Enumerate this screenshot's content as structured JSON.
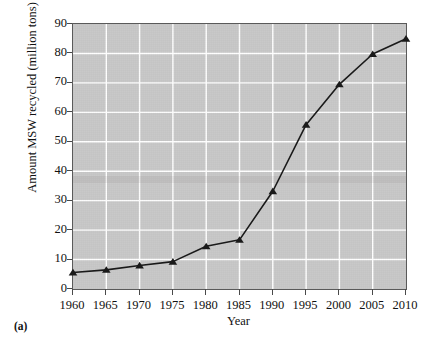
{
  "figure": {
    "panel_label": "(a)",
    "background_color": "#ffffff",
    "plot_background_color": "#c8c8c8",
    "gridline_color": "#ffffff",
    "series_color": "#1a1a1a",
    "frame_color": "#5a5a5a"
  },
  "chart_data": {
    "type": "line",
    "title": "",
    "xlabel": "Year",
    "ylabel": "Amount MSW recycled (million tons)",
    "x": [
      1960,
      1965,
      1970,
      1975,
      1980,
      1985,
      1990,
      1995,
      2000,
      2005,
      2010
    ],
    "values": [
      5.6,
      6.5,
      8.0,
      9.3,
      14.5,
      16.7,
      33.2,
      55.8,
      69.5,
      79.8,
      85.0
    ],
    "xlim": [
      1960,
      2010
    ],
    "ylim": [
      0,
      90
    ],
    "xticks": [
      1960,
      1965,
      1970,
      1975,
      1980,
      1985,
      1990,
      1995,
      2000,
      2005,
      2010
    ],
    "xtick_labels": [
      "1960",
      "1965",
      "1970",
      "1975",
      "1980",
      "1985",
      "1990",
      "1995",
      "2000",
      "2005",
      "2010"
    ],
    "yticks": [
      0,
      10,
      20,
      30,
      40,
      50,
      60,
      70,
      80,
      90
    ],
    "ytick_labels": [
      "0",
      "10",
      "20",
      "30",
      "40",
      "50",
      "60",
      "70",
      "80",
      "90"
    ],
    "grid": true,
    "legend": null,
    "marker": "triangle",
    "line_width": 1.6
  }
}
